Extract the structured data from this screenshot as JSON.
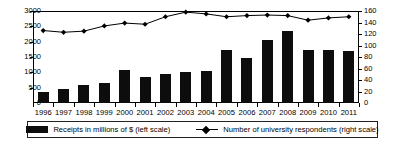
{
  "chart_data": {
    "type": "bar",
    "title": "",
    "xlabel": "",
    "ylabel": "",
    "grid": false,
    "legend_position": "bottom",
    "categories": [
      "1996",
      "1997",
      "1998",
      "1999",
      "2000",
      "2001",
      "2002",
      "2003",
      "2004",
      "2005",
      "2006",
      "2007",
      "2008",
      "2009",
      "2010",
      "2011"
    ],
    "series": [
      {
        "name": "Receipts in millions of $ (left scale)",
        "type": "bar",
        "axis": "left",
        "color": "#0d0d0d",
        "values": [
          350,
          460,
          590,
          650,
          1070,
          840,
          960,
          1000,
          1050,
          1740,
          1480,
          2060,
          2340,
          1740,
          1740,
          1680
        ]
      },
      {
        "name": "Number of university respondents (right scale)",
        "type": "line",
        "axis": "right",
        "color": "#000000",
        "marker": "diamond",
        "values": [
          126,
          123,
          125,
          134,
          139,
          137,
          150,
          158,
          155,
          150,
          152,
          153,
          152,
          144,
          148,
          150
        ]
      }
    ],
    "left_axis": {
      "label": "",
      "ticks": [
        0,
        500,
        1000,
        1500,
        2000,
        2500,
        3000
      ],
      "ylim": [
        0,
        3000
      ]
    },
    "right_axis": {
      "label": "",
      "ticks": [
        0,
        20,
        40,
        60,
        80,
        100,
        120,
        140,
        160
      ],
      "ylim": [
        0,
        160
      ]
    }
  },
  "legend": {
    "items": [
      {
        "label": "Receipts in millions of $ (left scale)",
        "marker": "bar-swatch"
      },
      {
        "label": "Number of university respondents (right scale)",
        "marker": "line-diamond"
      }
    ]
  },
  "colors": {
    "bar": "#0d0d0d",
    "line": "#000000",
    "axis": "#000000",
    "background": "#ffffff"
  }
}
